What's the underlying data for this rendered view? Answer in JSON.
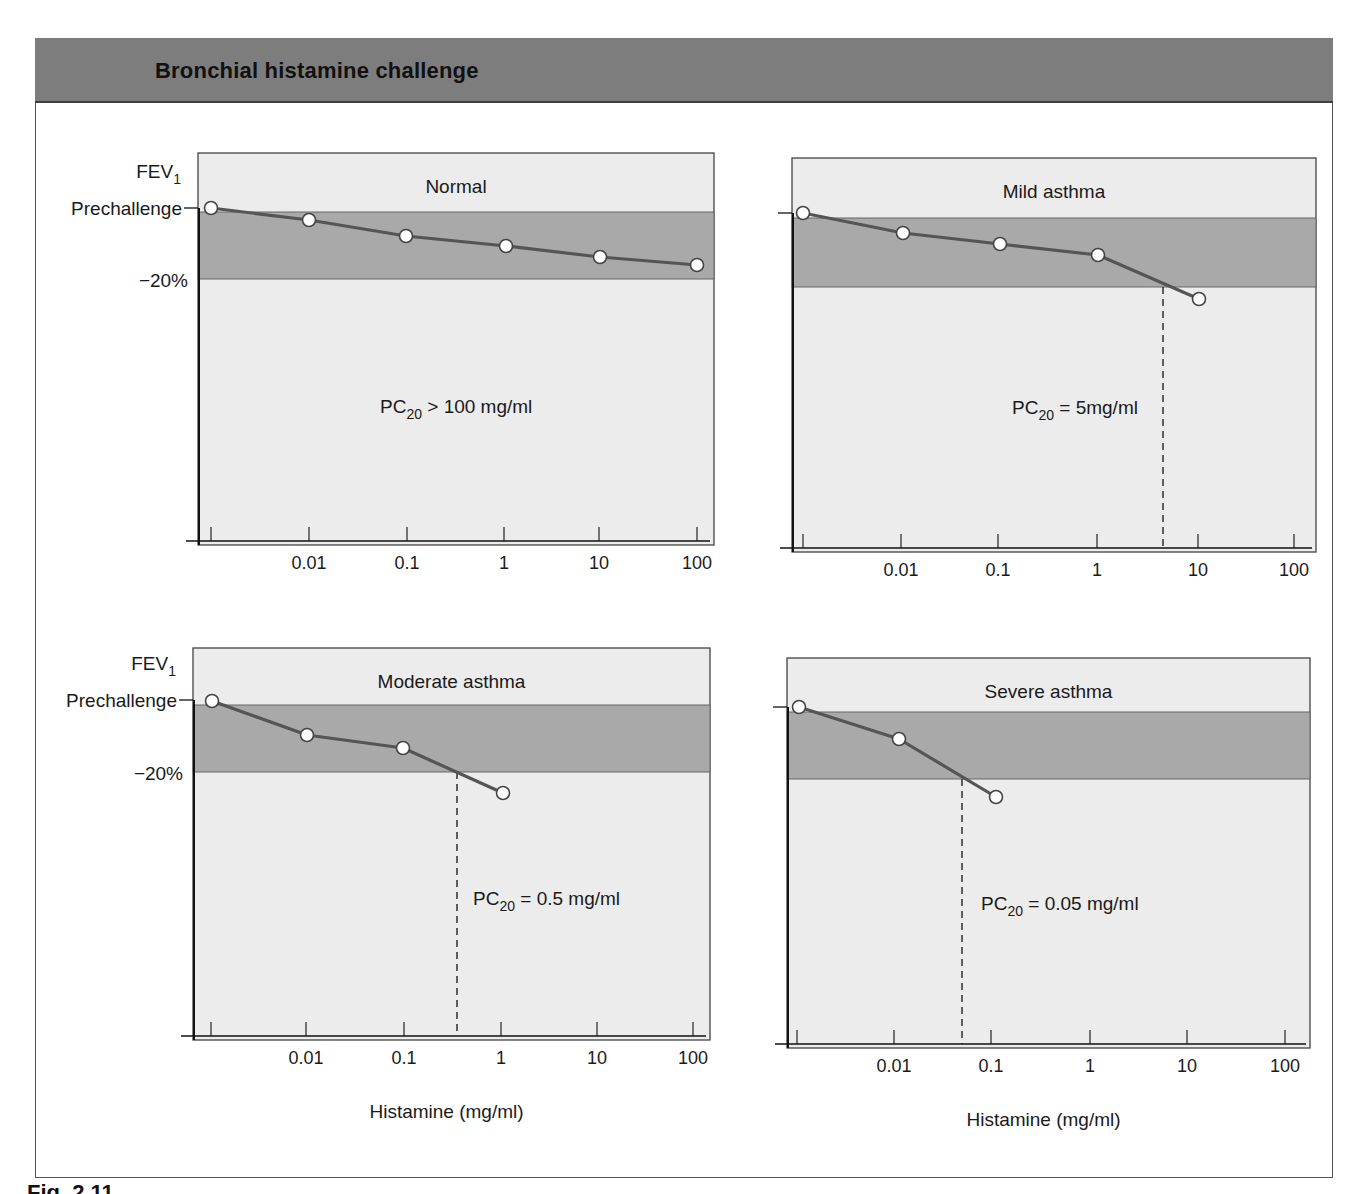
{
  "header": {
    "title": "Bronchial histamine challenge"
  },
  "caption_fragment": "Fig. 2.11",
  "y_axis": {
    "label_main": "FEV",
    "label_sub": "1",
    "prechallenge_label": "Prechallenge",
    "threshold_label": "−20%"
  },
  "x_axis": {
    "label": "Histamine (mg/ml)",
    "tick_labels": [
      "0.01",
      "0.1",
      "1",
      "10",
      "100"
    ]
  },
  "colors": {
    "header_bg": "#7d7d7d",
    "plot_bg": "#ececec",
    "band_bg": "#a9a9a9",
    "line": "#555555",
    "marker_fill": "#ffffff"
  },
  "panels": [
    {
      "title": "Normal",
      "pc20_prefix": "PC",
      "pc20_sub": "20",
      "pc20_suffix": " > 100 mg/ml"
    },
    {
      "title": "Mild asthma",
      "pc20_prefix": "PC",
      "pc20_sub": "20",
      "pc20_suffix": " = 5mg/ml"
    },
    {
      "title": "Moderate asthma",
      "pc20_prefix": "PC",
      "pc20_sub": "20",
      "pc20_suffix": " = 0.5 mg/ml"
    },
    {
      "title": "Severe asthma",
      "pc20_prefix": "PC",
      "pc20_sub": "20",
      "pc20_suffix": " = 0.05 mg/ml"
    }
  ],
  "chart_data": [
    {
      "type": "line",
      "title": "Normal",
      "xlabel": "Histamine (mg/ml)",
      "ylabel": "FEV1 (fall from prechallenge)",
      "x_scale": "log",
      "x_ticks": [
        "0.01",
        "0.1",
        "1",
        "10",
        "100"
      ],
      "x": [
        "baseline",
        0.01,
        0.1,
        1,
        10,
        100
      ],
      "values_pct_fall": [
        0,
        3.5,
        8,
        11,
        14,
        17
      ],
      "threshold_pct_fall": 20,
      "pc20": "> 100 mg/ml",
      "pixel_points": [
        [
          211,
          208
        ],
        [
          309,
          220
        ],
        [
          406,
          236
        ],
        [
          506,
          246
        ],
        [
          600,
          257
        ],
        [
          697,
          265
        ]
      ],
      "box": {
        "x0": 198,
        "y0": 153,
        "x1": 714,
        "y1": 545
      },
      "band": {
        "y0": 212,
        "y1": 279
      },
      "prechallenge_y": 208,
      "dash_x": null
    },
    {
      "type": "line",
      "title": "Mild asthma",
      "xlabel": "",
      "ylabel": "FEV1 (fall from prechallenge)",
      "x_scale": "log",
      "x_ticks": [
        "0.01",
        "0.1",
        "1",
        "10",
        "100"
      ],
      "x": [
        "baseline",
        0.01,
        0.1,
        1,
        10
      ],
      "values_pct_fall": [
        0,
        6,
        9,
        12,
        25
      ],
      "threshold_pct_fall": 20,
      "pc20": "5 mg/ml",
      "pixel_points": [
        [
          803,
          213
        ],
        [
          903,
          233
        ],
        [
          1000,
          244
        ],
        [
          1098,
          255
        ],
        [
          1199,
          299
        ]
      ],
      "box": {
        "x0": 792,
        "y0": 158,
        "x1": 1316,
        "y1": 552
      },
      "band": {
        "y0": 218,
        "y1": 287
      },
      "prechallenge_y": 213,
      "dash_x": 1163
    },
    {
      "type": "line",
      "title": "Moderate asthma",
      "xlabel": "Histamine (mg/ml)",
      "ylabel": "FEV1 (fall from prechallenge)",
      "x_scale": "log",
      "x_ticks": [
        "0.01",
        "0.1",
        "1",
        "10",
        "100"
      ],
      "x": [
        "baseline",
        0.01,
        0.1,
        1
      ],
      "values_pct_fall": [
        0,
        10,
        14,
        27
      ],
      "threshold_pct_fall": 20,
      "pc20": "0.5 mg/ml",
      "pixel_points": [
        [
          212,
          701
        ],
        [
          307,
          735
        ],
        [
          403,
          748
        ],
        [
          503,
          793
        ]
      ],
      "box": {
        "x0": 193,
        "y0": 648,
        "x1": 710,
        "y1": 1040
      },
      "band": {
        "y0": 705,
        "y1": 772
      },
      "prechallenge_y": 700,
      "dash_x": 457
    },
    {
      "type": "line",
      "title": "Severe asthma",
      "xlabel": "Histamine (mg/ml)",
      "ylabel": "FEV1 (fall from prechallenge)",
      "x_scale": "log",
      "x_ticks": [
        "0.01",
        "0.1",
        "1",
        "10",
        "100"
      ],
      "x": [
        "baseline",
        0.01,
        0.1
      ],
      "values_pct_fall": [
        0,
        9.5,
        27
      ],
      "threshold_pct_fall": 20,
      "pc20": "0.05 mg/ml",
      "pixel_points": [
        [
          799,
          707
        ],
        [
          899,
          739
        ],
        [
          996,
          797
        ]
      ],
      "box": {
        "x0": 787,
        "y0": 658,
        "x1": 1310,
        "y1": 1048
      },
      "band": {
        "y0": 712,
        "y1": 779
      },
      "prechallenge_y": 707,
      "dash_x": 962
    }
  ],
  "layout": {
    "ticks": [
      [
        211,
        309,
        407,
        504,
        599,
        697
      ],
      [
        803,
        901,
        998,
        1097,
        1198,
        1294
      ],
      [
        211,
        306,
        404,
        501,
        597,
        693
      ],
      [
        797,
        894,
        991,
        1090,
        1187,
        1285
      ]
    ]
  }
}
